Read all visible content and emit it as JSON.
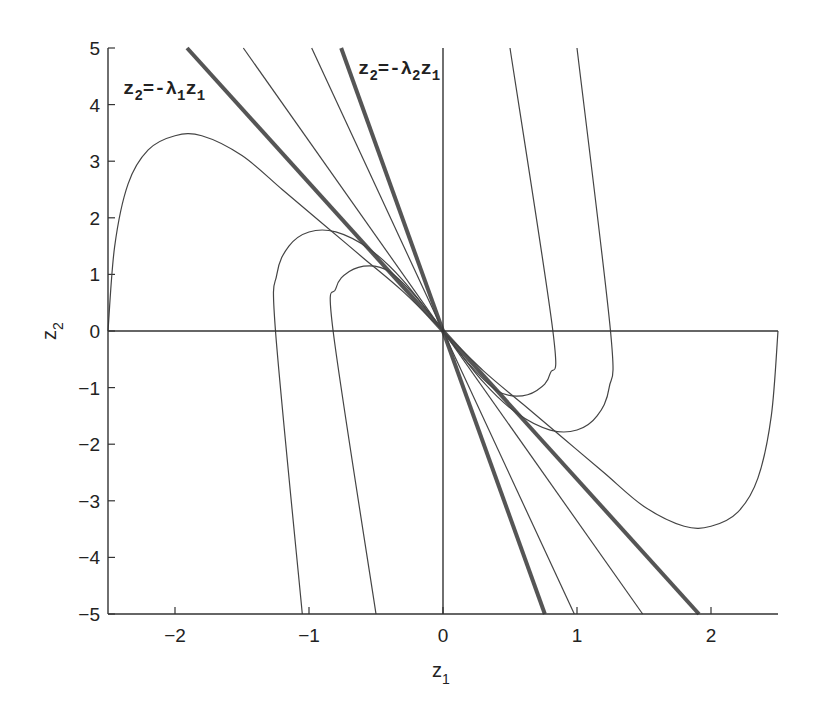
{
  "chart_data": {
    "type": "line",
    "title": "",
    "xlabel": "z1",
    "ylabel": "z2",
    "xlim": [
      -2.5,
      2.5
    ],
    "ylim": [
      -5,
      5
    ],
    "grid": false,
    "legend": "none",
    "x_ticks": [
      "-2",
      "-1",
      "0",
      "1",
      "2"
    ],
    "y_ticks": [
      "5",
      "4",
      "3",
      "2",
      "1",
      "0",
      "-1",
      "-2",
      "-3",
      "-4",
      "-5"
    ],
    "annotations": [
      {
        "text": "z2=-λ1 z1",
        "position": [
          -2.35,
          4.6
        ]
      },
      {
        "text": "z2=-λ2 z1",
        "position": [
          -0.6,
          4.6
        ]
      }
    ],
    "series": [
      {
        "name": "z2=-λ1 z1 (eigenline, thick)",
        "style": "thick",
        "x": [
          -1.91,
          1.91
        ],
        "y": [
          5,
          -5
        ]
      },
      {
        "name": "z2=-λ2 z1 (eigenline, thick)",
        "style": "thick",
        "x": [
          -0.76,
          0.76
        ],
        "y": [
          5,
          -5
        ]
      },
      {
        "name": "trajectory line A",
        "style": "thin",
        "x": [
          -1.49,
          1.49
        ],
        "y": [
          5,
          -5
        ]
      },
      {
        "name": "trajectory line B",
        "style": "thin",
        "x": [
          -0.98,
          0.98
        ],
        "y": [
          5,
          -5
        ]
      },
      {
        "name": "trajectory upper-left large",
        "style": "thin",
        "x": [
          -2.5,
          -2.45,
          -2.35,
          -2.2,
          -2.0,
          -1.8,
          -1.5,
          -1.2,
          -0.9,
          -0.6,
          -0.3,
          0
        ],
        "y": [
          0,
          1.5,
          2.6,
          3.2,
          3.45,
          3.45,
          3.1,
          2.5,
          1.9,
          1.3,
          0.7,
          0
        ]
      },
      {
        "name": "trajectory upper-left medium",
        "style": "thin",
        "x": [
          -1.05,
          -1.25,
          -1.24,
          -1.15,
          -1.0,
          -0.8,
          -0.55,
          -0.3,
          0
        ],
        "y": [
          -5,
          0,
          1.0,
          1.5,
          1.75,
          1.75,
          1.45,
          0.9,
          0
        ]
      },
      {
        "name": "trajectory upper-left small",
        "style": "thin",
        "x": [
          -0.5,
          -0.82,
          -0.8,
          -0.7,
          -0.55,
          -0.4,
          -0.2,
          0
        ],
        "y": [
          -5,
          0,
          0.75,
          1.05,
          1.15,
          1.05,
          0.6,
          0
        ]
      },
      {
        "name": "trajectory lower-right large",
        "style": "thin",
        "x": [
          2.5,
          2.45,
          2.35,
          2.2,
          2.0,
          1.8,
          1.5,
          1.2,
          0.9,
          0.6,
          0.3,
          0
        ],
        "y": [
          0,
          -1.5,
          -2.6,
          -3.2,
          -3.45,
          -3.45,
          -3.1,
          -2.5,
          -1.9,
          -1.3,
          -0.7,
          0
        ]
      },
      {
        "name": "trajectory lower-right medium",
        "style": "thin",
        "x": [
          1.0,
          1.25,
          1.24,
          1.15,
          1.0,
          0.8,
          0.55,
          0.3,
          0
        ],
        "y": [
          5,
          0,
          -1.0,
          -1.5,
          -1.75,
          -1.75,
          -1.45,
          -0.9,
          0
        ]
      },
      {
        "name": "trajectory lower-right small",
        "style": "thin",
        "x": [
          0.5,
          0.82,
          0.8,
          0.7,
          0.55,
          0.4,
          0.2,
          0
        ],
        "y": [
          5,
          0,
          -0.75,
          -1.05,
          -1.15,
          -1.05,
          -0.6,
          0
        ]
      }
    ]
  },
  "axes": {
    "x_label_main": "z",
    "x_label_sub": "1",
    "y_label_main": "z",
    "y_label_sub": "2"
  },
  "annotations": {
    "lambda1": {
      "z": "z",
      "sub2": "2",
      "eq": "=-λ",
      "sub_l": "1",
      "z1": "z",
      "sub1": "1"
    },
    "lambda2": {
      "z": "z",
      "sub2": "2",
      "eq": "=-λ",
      "sub_l": "2",
      "z1": "z",
      "sub1": "1"
    }
  },
  "colors": {
    "line": "#444444",
    "thick_line": "#555555",
    "axis": "#333333",
    "background": "#ffffff"
  }
}
